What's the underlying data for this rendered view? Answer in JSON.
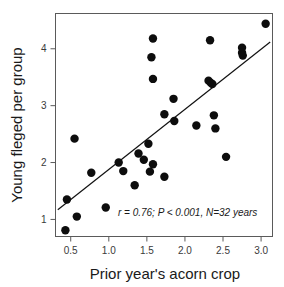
{
  "chart_data": {
    "type": "scatter",
    "title": "",
    "subtitle": "",
    "xlabel": "Prior year's acorn crop",
    "ylabel": "Young fleged per group",
    "xlim": [
      0.3,
      3.15
    ],
    "ylim": [
      0.7,
      4.62
    ],
    "xticks": [
      0.5,
      1.0,
      1.5,
      2.0,
      2.5,
      3.0
    ],
    "xtick_labels": [
      "0.5",
      "1.0",
      "1.5",
      "2.0",
      "2.5",
      "3.0"
    ],
    "yticks": [
      1,
      2,
      3,
      4
    ],
    "ytick_labels": [
      "1",
      "2",
      "3",
      "4"
    ],
    "grid": false,
    "legend": null,
    "annotations": [
      {
        "text": "r = 0.76; P < 0.001, N=32 years",
        "x": 1.12,
        "y": 1.06,
        "style": "italic"
      }
    ],
    "point_color": "#0d0d0d",
    "point_radius_px": 4.2,
    "line_color": "#111111",
    "frame_color": "#5a5a5a",
    "trendline": {
      "type": "linear",
      "x_start": 0.33,
      "y_start": 1.17,
      "x_end": 3.12,
      "y_end": 4.12
    },
    "x": [
      0.46,
      0.44,
      0.57,
      0.8,
      1.0,
      1.13,
      1.17,
      1.3,
      1.36,
      1.39,
      1.42,
      1.45,
      1.5,
      1.54,
      1.55,
      1.56,
      1.57,
      1.58,
      1.6,
      1.63,
      1.73,
      1.86,
      1.88,
      2.15,
      2.32,
      2.34,
      2.36,
      2.4,
      2.41,
      2.54,
      2.74,
      2.75,
      2.76,
      3.06
    ],
    "y": [
      1.35,
      0.81,
      1.05,
      1.82,
      1.21,
      2.0,
      1.85,
      1.6,
      2.16,
      2.05,
      2.33,
      1.84,
      1.97,
      4.18,
      3.85,
      3.47,
      2.85,
      1.75,
      3.12,
      2.73,
      1.75,
      2.65,
      2.83,
      2.6,
      3.44,
      3.38,
      4.15,
      2.1,
      4.02,
      3.92,
      3.88,
      4.44,
      2.42,
      1.85
    ],
    "points": [
      {
        "x": 0.43,
        "y": 0.81
      },
      {
        "x": 0.45,
        "y": 1.35
      },
      {
        "x": 0.55,
        "y": 2.42
      },
      {
        "x": 0.58,
        "y": 1.05
      },
      {
        "x": 0.77,
        "y": 1.82
      },
      {
        "x": 0.96,
        "y": 1.21
      },
      {
        "x": 1.13,
        "y": 2.0
      },
      {
        "x": 1.19,
        "y": 1.85
      },
      {
        "x": 1.34,
        "y": 1.6
      },
      {
        "x": 1.39,
        "y": 2.16
      },
      {
        "x": 1.46,
        "y": 2.05
      },
      {
        "x": 1.52,
        "y": 2.33
      },
      {
        "x": 1.54,
        "y": 1.84
      },
      {
        "x": 1.58,
        "y": 1.97
      },
      {
        "x": 1.58,
        "y": 4.18
      },
      {
        "x": 1.56,
        "y": 3.85
      },
      {
        "x": 1.58,
        "y": 3.47
      },
      {
        "x": 1.73,
        "y": 2.85
      },
      {
        "x": 1.73,
        "y": 1.75
      },
      {
        "x": 1.85,
        "y": 3.12
      },
      {
        "x": 1.86,
        "y": 2.73
      },
      {
        "x": 2.15,
        "y": 2.65
      },
      {
        "x": 2.31,
        "y": 3.44
      },
      {
        "x": 2.34,
        "y": 3.4
      },
      {
        "x": 2.36,
        "y": 3.38
      },
      {
        "x": 2.33,
        "y": 4.15
      },
      {
        "x": 2.38,
        "y": 2.83
      },
      {
        "x": 2.4,
        "y": 2.6
      },
      {
        "x": 2.54,
        "y": 2.1
      },
      {
        "x": 2.75,
        "y": 4.02
      },
      {
        "x": 2.75,
        "y": 3.93
      },
      {
        "x": 2.76,
        "y": 3.88
      },
      {
        "x": 3.06,
        "y": 4.44
      }
    ],
    "stats": {
      "r": "0.76",
      "p": "P < 0.001",
      "n": "N=32 years"
    }
  }
}
